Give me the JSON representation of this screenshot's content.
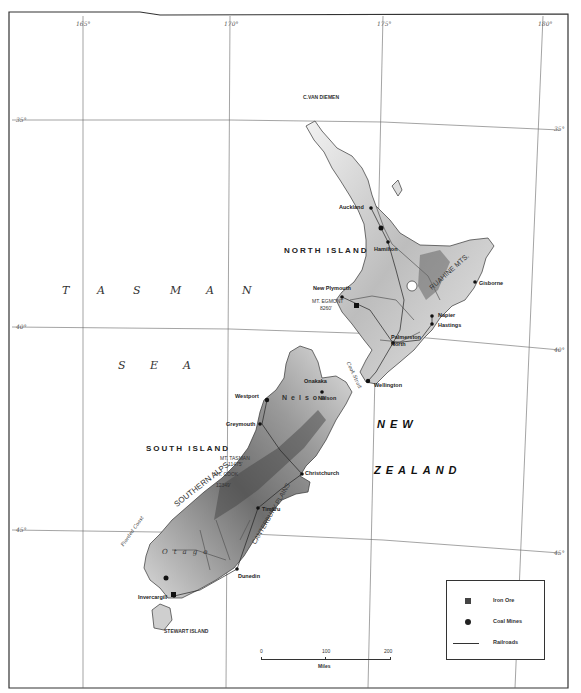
{
  "map": {
    "title": "New Zealand",
    "longitude_ticks": [
      {
        "label": "165°",
        "x": 83
      },
      {
        "label": "170°",
        "x": 230
      },
      {
        "label": "175°",
        "x": 383
      },
      {
        "label": "180°",
        "x": 543
      }
    ],
    "latitude_ticks": [
      {
        "label": "35°",
        "side": "left",
        "y": 120
      },
      {
        "label": "35°",
        "side": "right",
        "y": 129
      },
      {
        "label": "40°",
        "side": "left",
        "y": 327
      },
      {
        "label": "40°",
        "side": "right",
        "y": 350
      },
      {
        "label": "45°",
        "side": "left",
        "y": 530
      },
      {
        "label": "45°",
        "side": "right",
        "y": 553
      }
    ],
    "sea_labels": {
      "tasman": [
        "T",
        "A",
        "S",
        "M",
        "A",
        "N"
      ],
      "sea": [
        "S",
        "E",
        "A"
      ]
    },
    "country_label": {
      "line1": "NEW",
      "line2": "ZEALAND"
    },
    "islands": {
      "north": "NORTH ISLAND",
      "south": "SOUTH ISLAND",
      "stewart": "STEWART ISLAND"
    },
    "features": {
      "cape": "C.VAN DIEMEN",
      "mt_egmont": "MT. EGMONT",
      "mt_egmont_height": "8260'",
      "mt_cook": "MT. COOK",
      "mt_cook_height": "12349'",
      "mt_tasman": "MT. TASMAN",
      "mt_tasman_height": "11475'",
      "ruahine": "RUAHINE MTS.",
      "southern_alps": "SOUTHERN ALPS",
      "canterbury": "CANTERBURY PLAINS",
      "fiorded_coast": "Fiorded Coast",
      "otago": "Otago",
      "nelson": "Nelson",
      "cook_strait": "Cook Strait"
    },
    "cities": [
      {
        "name": "Auckland",
        "x": 371,
        "y": 208
      },
      {
        "name": "Hamilton",
        "x": 388,
        "y": 242
      },
      {
        "name": "New Plymouth",
        "x": 342,
        "y": 297
      },
      {
        "name": "Gisborne",
        "x": 475,
        "y": 282
      },
      {
        "name": "Napier",
        "x": 432,
        "y": 316
      },
      {
        "name": "Hastings",
        "x": 432,
        "y": 324
      },
      {
        "name": "Palmerston North",
        "x": 393,
        "y": 343
      },
      {
        "name": "Wellington",
        "x": 368,
        "y": 381
      },
      {
        "name": "Onakaka",
        "x": 320,
        "y": 383
      },
      {
        "name": "Nelson",
        "x": 322,
        "y": 392
      },
      {
        "name": "Westport",
        "x": 267,
        "y": 400
      },
      {
        "name": "Greymouth",
        "x": 260,
        "y": 424
      },
      {
        "name": "Christchurch",
        "x": 302,
        "y": 474
      },
      {
        "name": "Timaru",
        "x": 258,
        "y": 508
      },
      {
        "name": "Dunedin",
        "x": 237,
        "y": 569
      },
      {
        "name": "Invercargill",
        "x": 174,
        "y": 596
      }
    ],
    "legend": {
      "items": [
        {
          "symbol": "square",
          "label": "Iron Ore"
        },
        {
          "symbol": "circle",
          "label": "Coal Mines"
        },
        {
          "symbol": "railroad",
          "label": "Railroads"
        }
      ]
    },
    "scale_bar": {
      "ticks": [
        "0",
        "100",
        "200"
      ],
      "unit": "Miles"
    },
    "colors": {
      "ink": "#222222",
      "land_light": "#e8e8e8",
      "land_dark": "#7a7a7a",
      "water": "#ffffff"
    }
  }
}
